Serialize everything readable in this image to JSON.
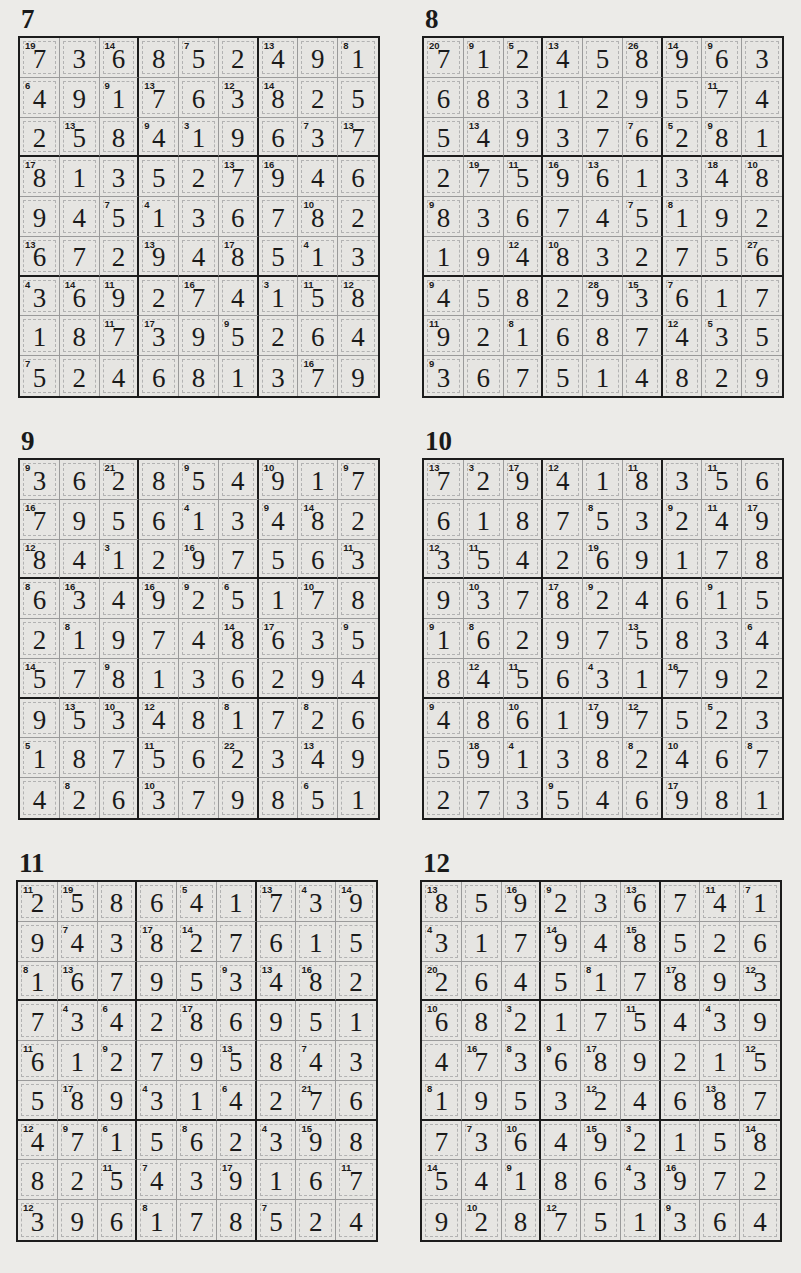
{
  "page": {
    "type": "Killer Sudoku solutions",
    "puzzles": [
      {
        "number": "7",
        "grid": [
          [
            7,
            3,
            6,
            8,
            5,
            2,
            4,
            9,
            1
          ],
          [
            4,
            9,
            1,
            7,
            6,
            3,
            8,
            2,
            5
          ],
          [
            2,
            5,
            8,
            4,
            1,
            9,
            6,
            3,
            7
          ],
          [
            8,
            1,
            3,
            5,
            2,
            7,
            9,
            4,
            6
          ],
          [
            9,
            4,
            5,
            1,
            3,
            6,
            7,
            8,
            2
          ],
          [
            6,
            7,
            2,
            9,
            4,
            8,
            5,
            1,
            3
          ],
          [
            3,
            6,
            9,
            2,
            7,
            4,
            1,
            5,
            8
          ],
          [
            1,
            8,
            7,
            3,
            9,
            5,
            2,
            6,
            4
          ],
          [
            5,
            2,
            4,
            6,
            8,
            1,
            3,
            7,
            9
          ]
        ],
        "clues": [
          [
            "19",
            "",
            "14",
            "",
            "7",
            "",
            "13",
            "",
            "8"
          ],
          [
            "6",
            "",
            "9",
            "13",
            "",
            "12",
            "14",
            "",
            ""
          ],
          [
            "",
            "13",
            "",
            "9",
            "3",
            "",
            "",
            "7",
            "13"
          ],
          [
            "17",
            "",
            "",
            "",
            "",
            "13",
            "16",
            "",
            ""
          ],
          [
            "",
            "",
            "7",
            "4",
            "",
            "",
            "",
            "10",
            ""
          ],
          [
            "13",
            "",
            "",
            "13",
            "",
            "17",
            "",
            "4",
            ""
          ],
          [
            "4",
            "14",
            "11",
            "",
            "16",
            "",
            "3",
            "11",
            "12"
          ],
          [
            "",
            "",
            "11",
            "17",
            "",
            "9",
            "",
            "",
            ""
          ],
          [
            "7",
            "",
            "",
            "",
            "",
            "",
            "",
            "16",
            ""
          ]
        ]
      },
      {
        "number": "8",
        "grid": [
          [
            7,
            1,
            2,
            4,
            5,
            8,
            9,
            6,
            3
          ],
          [
            6,
            8,
            3,
            1,
            2,
            9,
            5,
            7,
            4
          ],
          [
            5,
            4,
            9,
            3,
            7,
            6,
            2,
            8,
            1
          ],
          [
            2,
            7,
            5,
            9,
            6,
            1,
            3,
            4,
            8
          ],
          [
            8,
            3,
            6,
            7,
            4,
            5,
            1,
            9,
            2
          ],
          [
            1,
            9,
            4,
            8,
            3,
            2,
            7,
            5,
            6
          ],
          [
            4,
            5,
            8,
            2,
            9,
            3,
            6,
            1,
            7
          ],
          [
            9,
            2,
            1,
            6,
            8,
            7,
            4,
            3,
            5
          ],
          [
            3,
            6,
            7,
            5,
            1,
            4,
            8,
            2,
            9
          ]
        ],
        "clues": [
          [
            "20",
            "9",
            "5",
            "13",
            "",
            "26",
            "14",
            "9",
            ""
          ],
          [
            "",
            "",
            "",
            "",
            "",
            "",
            "",
            "11",
            ""
          ],
          [
            "",
            "13",
            "",
            "",
            "",
            "7",
            "5",
            "9",
            ""
          ],
          [
            "",
            "19",
            "11",
            "16",
            "13",
            "",
            "",
            "18",
            "10"
          ],
          [
            "9",
            "",
            "",
            "",
            "",
            "7",
            "8",
            "",
            ""
          ],
          [
            "",
            "",
            "12",
            "10",
            "",
            "",
            "",
            "",
            "27"
          ],
          [
            "9",
            "",
            "",
            "",
            "28",
            "15",
            "7",
            "",
            ""
          ],
          [
            "11",
            "",
            "8",
            "",
            "",
            "",
            "12",
            "5",
            ""
          ],
          [
            "9",
            "",
            "",
            "",
            "",
            "",
            "",
            "",
            ""
          ]
        ]
      },
      {
        "number": "9",
        "grid": [
          [
            3,
            6,
            2,
            8,
            5,
            4,
            9,
            1,
            7
          ],
          [
            7,
            9,
            5,
            6,
            1,
            3,
            4,
            8,
            2
          ],
          [
            8,
            4,
            1,
            2,
            9,
            7,
            5,
            6,
            3
          ],
          [
            6,
            3,
            4,
            9,
            2,
            5,
            1,
            7,
            8
          ],
          [
            2,
            1,
            9,
            7,
            4,
            8,
            6,
            3,
            5
          ],
          [
            5,
            7,
            8,
            1,
            3,
            6,
            2,
            9,
            4
          ],
          [
            9,
            5,
            3,
            4,
            8,
            1,
            7,
            2,
            6
          ],
          [
            1,
            8,
            7,
            5,
            6,
            2,
            3,
            4,
            9
          ],
          [
            4,
            2,
            6,
            3,
            7,
            9,
            8,
            5,
            1
          ]
        ],
        "clues": [
          [
            "9",
            "",
            "21",
            "",
            "9",
            "",
            "10",
            "",
            "9"
          ],
          [
            "16",
            "",
            "",
            "",
            "4",
            "",
            "9",
            "14",
            ""
          ],
          [
            "12",
            "",
            "3",
            "",
            "16",
            "",
            "",
            "",
            "11"
          ],
          [
            "8",
            "16",
            "",
            "16",
            "9",
            "6",
            "",
            "10",
            ""
          ],
          [
            "",
            "8",
            "",
            "",
            "",
            "14",
            "17",
            "",
            "9"
          ],
          [
            "14",
            "",
            "9",
            "",
            "",
            "",
            "",
            "",
            ""
          ],
          [
            "",
            "13",
            "10",
            "12",
            "",
            "8",
            "",
            "8",
            ""
          ],
          [
            "5",
            "",
            "",
            "11",
            "",
            "22",
            "",
            "13",
            ""
          ],
          [
            "",
            "8",
            "",
            "10",
            "",
            "",
            "",
            "6",
            ""
          ]
        ]
      },
      {
        "number": "10",
        "grid": [
          [
            7,
            2,
            9,
            4,
            1,
            8,
            3,
            5,
            6
          ],
          [
            6,
            1,
            8,
            7,
            5,
            3,
            2,
            4,
            9
          ],
          [
            3,
            5,
            4,
            2,
            6,
            9,
            1,
            7,
            8
          ],
          [
            9,
            3,
            7,
            8,
            2,
            4,
            6,
            1,
            5
          ],
          [
            1,
            6,
            2,
            9,
            7,
            5,
            8,
            3,
            4
          ],
          [
            8,
            4,
            5,
            6,
            3,
            1,
            7,
            9,
            2
          ],
          [
            4,
            8,
            6,
            1,
            9,
            7,
            5,
            2,
            3
          ],
          [
            5,
            9,
            1,
            3,
            8,
            2,
            4,
            6,
            7
          ],
          [
            2,
            7,
            3,
            5,
            4,
            6,
            9,
            8,
            1
          ]
        ],
        "clues": [
          [
            "13",
            "3",
            "17",
            "12",
            "",
            "11",
            "",
            "11",
            ""
          ],
          [
            "",
            "",
            "",
            "",
            "8",
            "",
            "9",
            "11",
            "17"
          ],
          [
            "12",
            "11",
            "",
            "",
            "19",
            "",
            "",
            "",
            ""
          ],
          [
            "",
            "10",
            "",
            "17",
            "9",
            "",
            "",
            "9",
            ""
          ],
          [
            "9",
            "8",
            "",
            "",
            "",
            "13",
            "",
            "",
            "6"
          ],
          [
            "",
            "12",
            "11",
            "",
            "4",
            "",
            "16",
            "",
            ""
          ],
          [
            "9",
            "",
            "10",
            "",
            "17",
            "12",
            "",
            "5",
            ""
          ],
          [
            "",
            "18",
            "4",
            "",
            "",
            "8",
            "10",
            "",
            "8"
          ],
          [
            "",
            "",
            "",
            "9",
            "",
            "",
            "17",
            "",
            ""
          ]
        ]
      },
      {
        "number": "11",
        "grid": [
          [
            2,
            5,
            8,
            6,
            4,
            1,
            7,
            3,
            9
          ],
          [
            9,
            4,
            3,
            8,
            2,
            7,
            6,
            1,
            5
          ],
          [
            1,
            6,
            7,
            9,
            5,
            3,
            4,
            8,
            2
          ],
          [
            7,
            3,
            4,
            2,
            8,
            6,
            9,
            5,
            1
          ],
          [
            6,
            1,
            2,
            7,
            9,
            5,
            8,
            4,
            3
          ],
          [
            5,
            8,
            9,
            3,
            1,
            4,
            2,
            7,
            6
          ],
          [
            4,
            7,
            1,
            5,
            6,
            2,
            3,
            9,
            8
          ],
          [
            8,
            2,
            5,
            4,
            3,
            9,
            1,
            6,
            7
          ],
          [
            3,
            9,
            6,
            1,
            7,
            8,
            5,
            2,
            4
          ]
        ],
        "clues": [
          [
            "11",
            "19",
            "",
            "",
            "5",
            "",
            "13",
            "4",
            "14"
          ],
          [
            "",
            "7",
            "",
            "17",
            "14",
            "",
            "",
            "",
            ""
          ],
          [
            "8",
            "13",
            "",
            "",
            "",
            "9",
            "13",
            "16",
            ""
          ],
          [
            "",
            "4",
            "6",
            "",
            "17",
            "",
            "",
            "",
            ""
          ],
          [
            "11",
            "",
            "9",
            "",
            "",
            "13",
            "",
            "7",
            ""
          ],
          [
            "",
            "17",
            "",
            "4",
            "",
            "6",
            "",
            "21",
            ""
          ],
          [
            "12",
            "9",
            "6",
            "",
            "8",
            "",
            "4",
            "15",
            ""
          ],
          [
            "",
            "",
            "11",
            "7",
            "",
            "17",
            "",
            "",
            "11"
          ],
          [
            "12",
            "",
            "",
            "8",
            "",
            "",
            "7",
            "",
            ""
          ]
        ]
      },
      {
        "number": "12",
        "grid": [
          [
            8,
            5,
            9,
            2,
            3,
            6,
            7,
            4,
            1
          ],
          [
            3,
            1,
            7,
            9,
            4,
            8,
            5,
            2,
            6
          ],
          [
            2,
            6,
            4,
            5,
            1,
            7,
            8,
            9,
            3
          ],
          [
            6,
            8,
            2,
            1,
            7,
            5,
            4,
            3,
            9
          ],
          [
            4,
            7,
            3,
            6,
            8,
            9,
            2,
            1,
            5
          ],
          [
            1,
            9,
            5,
            3,
            2,
            4,
            6,
            8,
            7
          ],
          [
            7,
            3,
            6,
            4,
            9,
            2,
            1,
            5,
            8
          ],
          [
            5,
            4,
            1,
            8,
            6,
            3,
            9,
            7,
            2
          ],
          [
            9,
            2,
            8,
            7,
            5,
            1,
            3,
            6,
            4
          ]
        ],
        "clues": [
          [
            "13",
            "",
            "16",
            "9",
            "",
            "13",
            "",
            "11",
            "7"
          ],
          [
            "4",
            "",
            "",
            "14",
            "",
            "15",
            "",
            "",
            ""
          ],
          [
            "20",
            "",
            "",
            "",
            "8",
            "",
            "17",
            "",
            "12"
          ],
          [
            "10",
            "",
            "3",
            "",
            "",
            "11",
            "",
            "4",
            ""
          ],
          [
            "",
            "16",
            "8",
            "9",
            "17",
            "",
            "",
            "",
            "12"
          ],
          [
            "8",
            "",
            "",
            "",
            "12",
            "",
            "",
            "13",
            ""
          ],
          [
            "",
            "7",
            "10",
            "",
            "15",
            "3",
            "",
            "",
            "14"
          ],
          [
            "14",
            "",
            "9",
            "",
            "",
            "4",
            "16",
            "",
            ""
          ],
          [
            "",
            "10",
            "",
            "12",
            "",
            "",
            "9",
            "",
            ""
          ]
        ]
      }
    ]
  }
}
